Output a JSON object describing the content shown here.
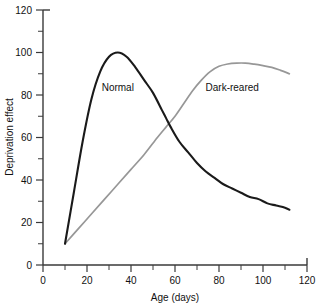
{
  "chart_data": {
    "type": "line",
    "title": "",
    "xlabel": "Age (days)",
    "ylabel": "Deprivation effect",
    "xlim": [
      0,
      120
    ],
    "ylim": [
      0,
      120
    ],
    "grid": false,
    "legend": "inline-annotations",
    "xticks": [
      0,
      20,
      40,
      60,
      80,
      100,
      120
    ],
    "xtick_labels": [
      "0",
      "20",
      "40",
      "60",
      "80",
      "100",
      "120"
    ],
    "xminor_step": 10,
    "yticks": [
      0,
      20,
      40,
      60,
      80,
      100,
      120
    ],
    "ytick_labels": [
      "0",
      "20",
      "40",
      "60",
      "80",
      "100",
      "120"
    ],
    "yminor_step": 10,
    "series": [
      {
        "name": "Normal",
        "color": "#1a1a1a",
        "label_x": 34,
        "label_y": 82,
        "x": [
          10,
          14,
          18,
          22,
          26,
          30,
          34,
          38,
          42,
          46,
          50,
          54,
          56,
          58,
          62,
          66,
          70,
          74,
          78,
          82,
          86,
          90,
          94,
          98,
          102,
          106,
          110,
          112
        ],
        "values": [
          10,
          34,
          58,
          78,
          91,
          98,
          100,
          98,
          93,
          87,
          81,
          73,
          69,
          65,
          58,
          53,
          48,
          44,
          41,
          38,
          36,
          34,
          32,
          31,
          29,
          28,
          27,
          26
        ]
      },
      {
        "name": "Dark-reared",
        "color": "#979797",
        "label_x": 86,
        "label_y": 82,
        "x": [
          10,
          16,
          22,
          28,
          34,
          40,
          46,
          52,
          56,
          60,
          64,
          68,
          72,
          76,
          80,
          84,
          88,
          92,
          96,
          100,
          104,
          108,
          112
        ],
        "values": [
          10,
          17,
          24,
          31,
          38,
          45,
          52,
          60,
          65,
          70,
          76,
          82,
          87,
          91,
          93.5,
          94.6,
          95,
          95,
          94.5,
          93.8,
          93,
          91.6,
          90
        ]
      }
    ],
    "crossing_point": {
      "x": 56,
      "y": 67
    }
  }
}
